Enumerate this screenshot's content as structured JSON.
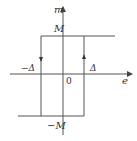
{
  "diagram": {
    "type": "hysteresis-loop",
    "axes": {
      "x_label": "e",
      "y_label": "m",
      "origin_label": "0"
    },
    "labels": {
      "top_level": "M",
      "bottom_level": "−M",
      "left_threshold": "−Δ",
      "right_threshold": "Δ"
    },
    "colors": {
      "line": "#555555",
      "text": "#333333",
      "background": "#ffffff"
    }
  }
}
